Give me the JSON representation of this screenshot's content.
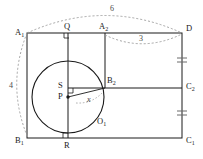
{
  "figure": {
    "type": "geometry-diagram",
    "canvas": {
      "width": 203,
      "height": 159
    },
    "colors": {
      "stroke": "#1a1a1a",
      "dimension_stroke": "#8a8a8a",
      "background": "#ffffff",
      "text": "#1a1a1a"
    },
    "vertices": {
      "A1": {
        "label": "A",
        "subscript": "1",
        "x": 27,
        "y": 33
      },
      "Q": {
        "label": "Q",
        "subscript": "",
        "x": 68,
        "y": 33
      },
      "A2": {
        "label": "A",
        "subscript": "2",
        "x": 105,
        "y": 33
      },
      "D": {
        "label": "D",
        "subscript": "",
        "x": 182,
        "y": 33
      },
      "B2": {
        "label": "B",
        "subscript": "2",
        "x": 105,
        "y": 88
      },
      "C2": {
        "label": "C",
        "subscript": "2",
        "x": 182,
        "y": 88
      },
      "S": {
        "label": "S",
        "subscript": "",
        "x": 68,
        "y": 88
      },
      "P": {
        "label": "P",
        "subscript": "",
        "x": 68,
        "y": 97
      },
      "O1": {
        "label": "O",
        "subscript": "1",
        "x": 100,
        "y": 121
      },
      "B1": {
        "label": "B",
        "subscript": "1",
        "x": 27,
        "y": 138
      },
      "R": {
        "label": "R",
        "subscript": "",
        "x": 68,
        "y": 138
      },
      "C1": {
        "label": "C",
        "subscript": "1",
        "x": 182,
        "y": 138
      }
    },
    "circle": {
      "center_label": "P",
      "name": "O",
      "name_subscript": "1",
      "cx": 68,
      "cy": 97,
      "r": 36
    },
    "dimensions": [
      {
        "id": "top-span",
        "value": "6",
        "from": "A1",
        "to": "D",
        "x": 113,
        "y": 11
      },
      {
        "id": "right-span",
        "value": "3",
        "from": "A2",
        "to": "D",
        "x": 142,
        "y": 40
      },
      {
        "id": "left-span",
        "value": "4",
        "from": "A1",
        "to": "B1",
        "x": 11,
        "y": 86
      },
      {
        "id": "radius",
        "value": "x",
        "from": "P",
        "to": "B2",
        "x": 89,
        "y": 100
      }
    ],
    "right_angle_marks": [
      {
        "id": "mark-at-Q",
        "x": 68,
        "y": 33
      },
      {
        "id": "mark-at-S",
        "x": 68,
        "y": 88
      },
      {
        "id": "mark-at-R",
        "x": 68,
        "y": 138
      }
    ],
    "tick_marks": [
      {
        "id": "tick-D-C2",
        "segment": "D-C2",
        "count": 2,
        "x": 182,
        "y": 60
      },
      {
        "id": "tick-C2-C1",
        "segment": "C2-C1",
        "count": 2,
        "x": 182,
        "y": 113
      }
    ]
  }
}
